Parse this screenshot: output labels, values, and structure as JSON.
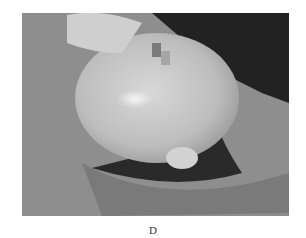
{
  "figure": {
    "panel_label": "D",
    "image_description": "Grayscale clinical photograph of an infant's head with a large swelling, lying on draped sheets, part of the face pixelated",
    "tones": {
      "background_sheet": "#8e8e8e",
      "head": "#c4c4c4",
      "highlight": "#efefef",
      "hair_shadow": "#1a1a1a",
      "dark_corner": "#222222"
    }
  }
}
